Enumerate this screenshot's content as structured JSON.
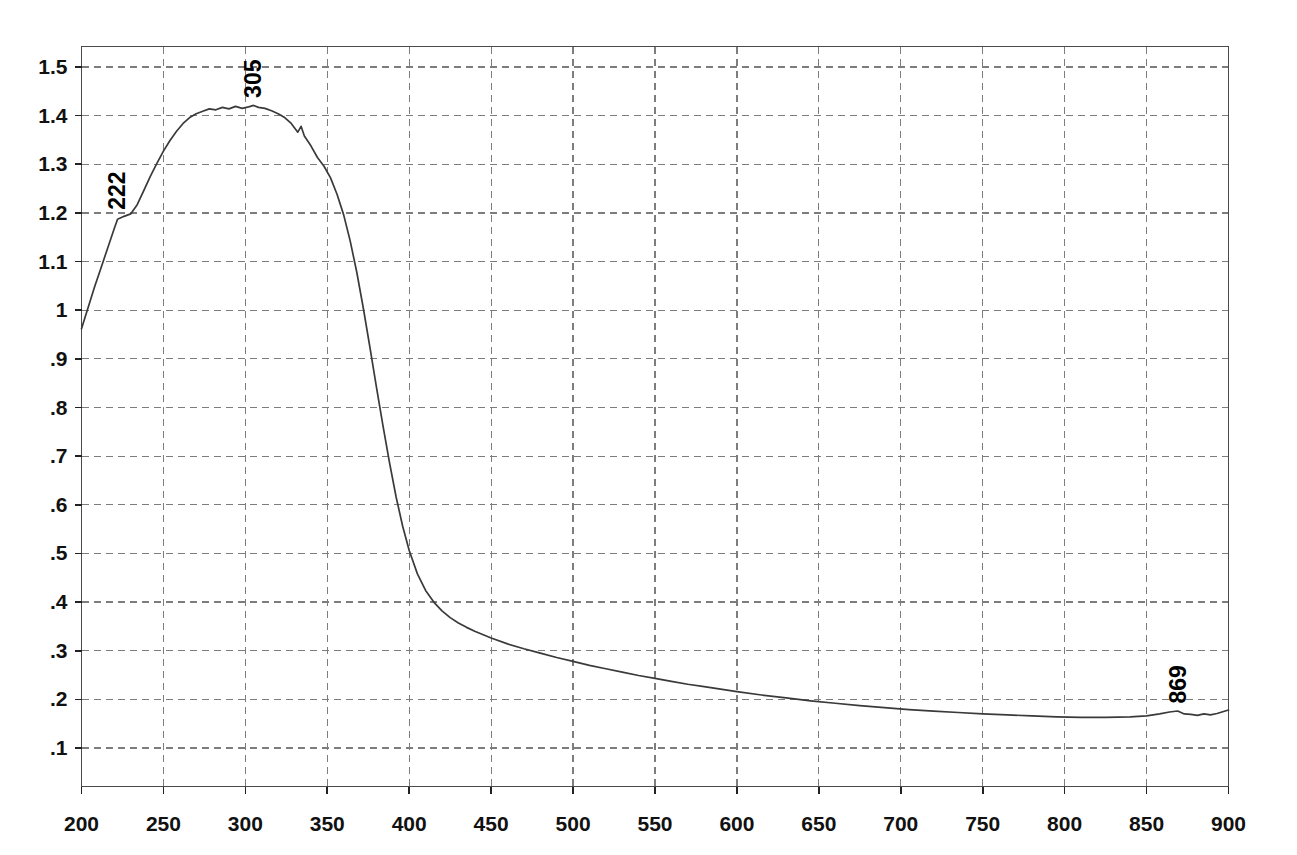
{
  "figure": {
    "name": "uv-vis-absorption-spectrum",
    "background_color": "#ffffff",
    "curve_color": "#3a3a3a",
    "grid_color": "#7d7d7d",
    "axis_color": "#4a4a4a"
  },
  "chart_data": {
    "type": "line",
    "title": "",
    "subtitle": "",
    "xlabel": "",
    "ylabel": "",
    "xlim": [
      200,
      900
    ],
    "ylim": [
      0.0,
      1.57
    ],
    "grid": true,
    "legend": null,
    "x_ticks": [
      200,
      250,
      300,
      350,
      400,
      450,
      500,
      550,
      600,
      650,
      700,
      750,
      800,
      850,
      900
    ],
    "x_tick_labels": [
      "200",
      "250",
      "300",
      "350",
      "400",
      "450",
      "500",
      "550",
      "600",
      "650",
      "700",
      "750",
      "800",
      "850",
      "900"
    ],
    "y_ticks": [
      0.1,
      0.2,
      0.3,
      0.4,
      0.5,
      0.6,
      0.7,
      0.8,
      0.9,
      1.0,
      1.1,
      1.2,
      1.3,
      1.4,
      1.5
    ],
    "y_tick_labels": [
      ".1",
      ".2",
      ".3",
      ".4",
      ".5",
      ".6",
      ".7",
      ".8",
      ".9",
      "1",
      "1.1",
      "1.2",
      "1.3",
      "1.4",
      "1.5"
    ],
    "annotations": [
      {
        "label": "222",
        "x": 222,
        "y": 1.19,
        "rotation": -90
      },
      {
        "label": "305",
        "x": 305,
        "y": 1.42,
        "rotation": -90
      },
      {
        "label": "869",
        "x": 869,
        "y": 0.175,
        "rotation": -90
      }
    ],
    "series": [
      {
        "name": "absorbance",
        "x": [
          200,
          204,
          208,
          212,
          216,
          220,
          222,
          226,
          230,
          234,
          238,
          242,
          246,
          250,
          254,
          258,
          262,
          266,
          270,
          274,
          278,
          282,
          286,
          290,
          294,
          298,
          302,
          305,
          308,
          312,
          316,
          320,
          324,
          328,
          332,
          334,
          336,
          340,
          344,
          348,
          352,
          356,
          360,
          364,
          368,
          372,
          376,
          380,
          384,
          388,
          392,
          396,
          400,
          405,
          410,
          415,
          420,
          425,
          430,
          435,
          440,
          450,
          460,
          470,
          480,
          490,
          500,
          510,
          520,
          530,
          540,
          550,
          560,
          570,
          580,
          590,
          600,
          615,
          630,
          645,
          660,
          675,
          690,
          705,
          720,
          735,
          750,
          765,
          780,
          795,
          810,
          825,
          840,
          850,
          858,
          864,
          869,
          873,
          877,
          881,
          885,
          889,
          893,
          897,
          900
        ],
        "y": [
          0.962,
          1.005,
          1.048,
          1.088,
          1.128,
          1.168,
          1.187,
          1.193,
          1.198,
          1.217,
          1.246,
          1.275,
          1.302,
          1.327,
          1.349,
          1.368,
          1.384,
          1.396,
          1.404,
          1.409,
          1.414,
          1.412,
          1.417,
          1.414,
          1.419,
          1.415,
          1.418,
          1.421,
          1.417,
          1.415,
          1.41,
          1.404,
          1.396,
          1.384,
          1.366,
          1.378,
          1.358,
          1.338,
          1.314,
          1.296,
          1.272,
          1.238,
          1.196,
          1.142,
          1.078,
          1.004,
          0.924,
          0.842,
          0.762,
          0.686,
          0.616,
          0.556,
          0.506,
          0.458,
          0.424,
          0.4,
          0.382,
          0.368,
          0.357,
          0.348,
          0.34,
          0.326,
          0.314,
          0.304,
          0.295,
          0.286,
          0.278,
          0.27,
          0.263,
          0.256,
          0.249,
          0.243,
          0.237,
          0.231,
          0.226,
          0.221,
          0.216,
          0.209,
          0.203,
          0.197,
          0.192,
          0.187,
          0.183,
          0.179,
          0.176,
          0.173,
          0.17,
          0.168,
          0.166,
          0.164,
          0.163,
          0.163,
          0.164,
          0.166,
          0.17,
          0.174,
          0.176,
          0.17,
          0.169,
          0.167,
          0.17,
          0.168,
          0.171,
          0.175,
          0.178
        ]
      }
    ]
  }
}
